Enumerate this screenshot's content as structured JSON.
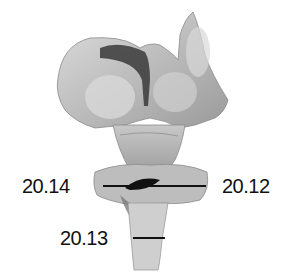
{
  "figure": {
    "colors": {
      "specimen_light": "#d4d4d4",
      "specimen_mid": "#a8a8a8",
      "specimen_dark": "#3a3a3a",
      "label": "#111111"
    }
  },
  "labels": [
    {
      "id": "label-20-14",
      "text": "20.14",
      "side": "left"
    },
    {
      "id": "label-20-12",
      "text": "20.12",
      "side": "right"
    },
    {
      "id": "label-20-13",
      "text": "20.13",
      "side": "left"
    }
  ]
}
